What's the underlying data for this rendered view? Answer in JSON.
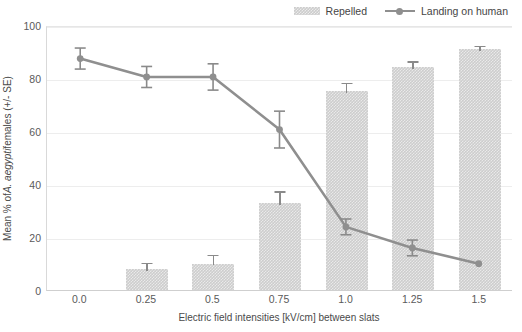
{
  "chart_data": {
    "type": "bar",
    "title": "",
    "xlabel": "Electric field intensities [kV/cm] between slats",
    "ylabel": "Mean % of A. aegypti females (+/- SE)",
    "ylabel_parts": {
      "prefix": "Mean % of ",
      "italic": "A. aegypti",
      "suffix": " females (+/- SE)"
    },
    "categories": [
      "0.0",
      "0.25",
      "0.5",
      "0.75",
      "1.0",
      "1.25",
      "1.5"
    ],
    "ylim": [
      0,
      100
    ],
    "yticks": [
      0,
      20,
      40,
      60,
      80,
      100
    ],
    "ytick_labels": [
      "0",
      "20",
      "40",
      "60",
      "80",
      "100"
    ],
    "grid": true,
    "legend_position": "top-right",
    "series": [
      {
        "name": "Repelled",
        "kind": "bar",
        "color": "#cdcdcd",
        "values": [
          0,
          8,
          10,
          33,
          75,
          84,
          91
        ],
        "errors": [
          0,
          3,
          4,
          5,
          4,
          3,
          2
        ]
      },
      {
        "name": "Landing on human",
        "kind": "line",
        "color": "#8f8f8f",
        "values": [
          88,
          81,
          81,
          61,
          24,
          16,
          10
        ],
        "errors": [
          4,
          4,
          5,
          7,
          3,
          3,
          0
        ]
      }
    ]
  },
  "legend": {
    "items": [
      {
        "label": "Repelled",
        "marker": "bar-swatch"
      },
      {
        "label": "Landing on human",
        "marker": "line-swatch"
      }
    ]
  },
  "colors": {
    "bar_fill": "#cdcdcd",
    "line_stroke": "#8f8f8f",
    "error_bar": "#8a8a8a",
    "gridline": "#ededed",
    "axis": "#cfcfcf",
    "text": "#4a4a4a",
    "background": "#ffffff"
  }
}
